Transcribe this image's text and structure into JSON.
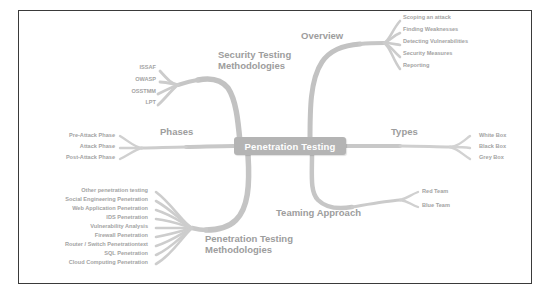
{
  "diagram": {
    "title": "Penetration Testing",
    "type": "mind-map",
    "colors": {
      "branch": "#c9c9c9",
      "label": "#a3a3a3",
      "central_node_fill": "#b4b4b4",
      "central_node_text": "#ffffff",
      "frame_border": "#3a3a3a",
      "background": "#ffffff"
    }
  },
  "central": {
    "label": "Penetration Testing"
  },
  "branches": [
    {
      "id": "overview",
      "label": "Overview",
      "label_x": 301,
      "label_y": 35,
      "leaves": [
        {
          "label": "Scoping an attack",
          "x": 403,
          "y": 18
        },
        {
          "label": "Finding Weaknesses",
          "x": 403,
          "y": 30
        },
        {
          "label": "Detecting Vulnerabilities",
          "x": 403,
          "y": 42
        },
        {
          "label": "Security Measures",
          "x": 403,
          "y": 54
        },
        {
          "label": "Reporting",
          "x": 403,
          "y": 66
        }
      ]
    },
    {
      "id": "security-testing-methodologies",
      "label": "Security Testing\nMethodologies",
      "label_x": 218,
      "label_y": 54,
      "leaves": [
        {
          "label": "ISSAF",
          "x": 156,
          "y": 68
        },
        {
          "label": "OWASP",
          "x": 156,
          "y": 80
        },
        {
          "label": "OSSTMM",
          "x": 156,
          "y": 92
        },
        {
          "label": "LPT",
          "x": 156,
          "y": 103
        }
      ]
    },
    {
      "id": "phases",
      "label": "Phases",
      "label_x": 160,
      "label_y": 131,
      "leaves": [
        {
          "label": "Pre-Attack Phase",
          "x": 115,
          "y": 136
        },
        {
          "label": "Attack Phase",
          "x": 115,
          "y": 147
        },
        {
          "label": "Post-Attack Phase",
          "x": 115,
          "y": 158
        }
      ]
    },
    {
      "id": "types",
      "label": "Types",
      "label_x": 391,
      "label_y": 131,
      "leaves": [
        {
          "label": "White Box",
          "x": 479,
          "y": 136
        },
        {
          "label": "Black Box",
          "x": 479,
          "y": 147
        },
        {
          "label": "Grey Box",
          "x": 479,
          "y": 158
        }
      ]
    },
    {
      "id": "teaming-approach",
      "label": "Teaming Approach",
      "label_x": 276,
      "label_y": 212,
      "leaves": [
        {
          "label": "Red Team",
          "x": 422,
          "y": 192
        },
        {
          "label": "Blue Team",
          "x": 422,
          "y": 206
        }
      ]
    },
    {
      "id": "penetration-testing-methodologies",
      "label": "Penetration Testing\nMethodologies",
      "label_x": 205,
      "label_y": 238,
      "leaves": [
        {
          "label": "Other penetration testing",
          "x": 148,
          "y": 191
        },
        {
          "label": "Social Engineering Penetration",
          "x": 148,
          "y": 200
        },
        {
          "label": "Web Application Penetration",
          "x": 148,
          "y": 209
        },
        {
          "label": "IDS Penetration",
          "x": 148,
          "y": 218
        },
        {
          "label": "Vulnerability Analysis",
          "x": 148,
          "y": 227
        },
        {
          "label": "Firewall Penetration",
          "x": 148,
          "y": 236
        },
        {
          "label": "Router / Switch Penetrationtext",
          "x": 148,
          "y": 245
        },
        {
          "label": "SQL Penetration",
          "x": 148,
          "y": 254
        },
        {
          "label": "Cloud Computing Penetration",
          "x": 148,
          "y": 263
        }
      ]
    }
  ]
}
